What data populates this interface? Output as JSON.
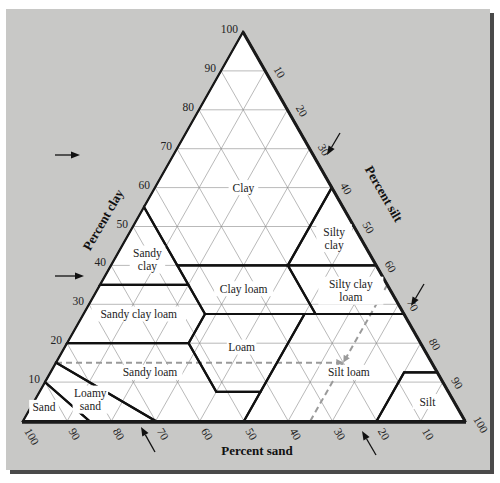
{
  "triangle": {
    "apex_clay": [
      243,
      32
    ],
    "corner_sand": [
      23,
      421
    ],
    "corner_silt": [
      465,
      421
    ]
  },
  "colors": {
    "panel": "#c8c8c6",
    "panel_shadow": "#4a4a4a",
    "triangle_fill": "#ffffff",
    "boundary": "#111111",
    "grid": "#8a8a8a",
    "dashed_guide": "#9a9a9a"
  },
  "axes": {
    "clay": {
      "title": "Percent clay",
      "ticks": [
        "10",
        "20",
        "30",
        "40",
        "50",
        "60",
        "70",
        "80",
        "90",
        "100"
      ]
    },
    "silt": {
      "title": "Percent silt",
      "ticks": [
        "10",
        "20",
        "30",
        "40",
        "50",
        "60",
        "70",
        "80",
        "90",
        "100"
      ]
    },
    "sand": {
      "title": "Percent sand",
      "ticks": [
        "100",
        "90",
        "80",
        "70",
        "60",
        "50",
        "40",
        "30",
        "20",
        "10"
      ]
    }
  },
  "regions": [
    {
      "name": "Clay",
      "label": [
        "Clay"
      ],
      "label_at": [
        60,
        20
      ],
      "points": [
        [
          40,
          45
        ],
        [
          55,
          45
        ],
        [
          100,
          0
        ],
        [
          60,
          0
        ],
        [
          40,
          20
        ]
      ]
    },
    {
      "name": "Sandy clay",
      "label": [
        "Sandy",
        "clay"
      ],
      "label_at": [
        41.5,
        51
      ],
      "points": [
        [
          35,
          65
        ],
        [
          55,
          45
        ],
        [
          35,
          45
        ]
      ]
    },
    {
      "name": "Silty clay",
      "label": [
        "Silty",
        "clay"
      ],
      "label_at": [
        47,
        6
      ],
      "points": [
        [
          40,
          20
        ],
        [
          60,
          0
        ],
        [
          40,
          0
        ]
      ]
    },
    {
      "name": "Sandy clay loam",
      "label": [
        "Sandy clay loam"
      ],
      "label_at": [
        27.5,
        60
      ],
      "points": [
        [
          20,
          80
        ],
        [
          35,
          65
        ],
        [
          35,
          45
        ],
        [
          27.5,
          45
        ],
        [
          20,
          52.5
        ]
      ]
    },
    {
      "name": "Clay loam",
      "label": [
        "Clay loam"
      ],
      "label_at": [
        34,
        33
      ],
      "points": [
        [
          27.5,
          45
        ],
        [
          40,
          45
        ],
        [
          40,
          20
        ],
        [
          27.5,
          20
        ]
      ]
    },
    {
      "name": "Silty clay loam",
      "label": [
        "Silty clay",
        "loam"
      ],
      "label_at": [
        33.5,
        9
      ],
      "points": [
        [
          27.5,
          20
        ],
        [
          40,
          20
        ],
        [
          40,
          0
        ],
        [
          27.5,
          0
        ]
      ]
    },
    {
      "name": "Loam",
      "label": [
        "Loam"
      ],
      "label_at": [
        19,
        41
      ],
      "points": [
        [
          7.5,
          52.5
        ],
        [
          20,
          52.5
        ],
        [
          27.5,
          45
        ],
        [
          27.5,
          22.5
        ],
        [
          7.5,
          42.5
        ]
      ]
    },
    {
      "name": "Sandy loam",
      "label": [
        "Sandy loam"
      ],
      "label_at": [
        12.5,
        65
      ],
      "points": [
        [
          0,
          70
        ],
        [
          15,
          85
        ],
        [
          20,
          80
        ],
        [
          20,
          52.5
        ],
        [
          7.5,
          52.5
        ],
        [
          7.5,
          42.5
        ],
        [
          0,
          50
        ]
      ]
    },
    {
      "name": "Silt loam",
      "label": [
        "Silt loam"
      ],
      "label_at": [
        12.5,
        20
      ],
      "points": [
        [
          0,
          50
        ],
        [
          7.5,
          42.5
        ],
        [
          27.5,
          22.5
        ],
        [
          27.5,
          0
        ],
        [
          12.5,
          0
        ],
        [
          12.5,
          7.5
        ],
        [
          0,
          20
        ]
      ]
    },
    {
      "name": "Silt",
      "label": [
        "Silt"
      ],
      "label_at": [
        5,
        6
      ],
      "points": [
        [
          0,
          20
        ],
        [
          12.5,
          7.5
        ],
        [
          12.5,
          0
        ],
        [
          0,
          0
        ]
      ]
    },
    {
      "name": "Loamy sand",
      "label": [
        "Loamy",
        "sand"
      ],
      "label_at": [
        5.5,
        82
      ],
      "points": [
        [
          0,
          85
        ],
        [
          10,
          90
        ],
        [
          15,
          85
        ],
        [
          0,
          70
        ]
      ]
    },
    {
      "name": "Sand",
      "label": [
        "Sand"
      ],
      "label_at": [
        3.5,
        93.5
      ],
      "points": [
        [
          0,
          100
        ],
        [
          10,
          90
        ],
        [
          0,
          85
        ]
      ]
    }
  ],
  "guides": {
    "example_point": {
      "clay": 15,
      "sand": 20,
      "silt": 65
    },
    "dashed_lines": [
      {
        "from": [
          15,
          85
        ],
        "to": [
          15,
          20
        ]
      },
      {
        "from": [
          0,
          35
        ],
        "to": [
          15,
          20
        ]
      },
      {
        "from": [
          35,
          0
        ],
        "to": [
          15,
          20
        ]
      }
    ]
  },
  "arrows": [
    {
      "name": "clay-axis-arrow-upper",
      "from": [
        55,
        155
      ],
      "to": [
        80,
        155
      ]
    },
    {
      "name": "clay-axis-arrow-lower",
      "from": [
        55,
        276
      ],
      "to": [
        84,
        276
      ]
    },
    {
      "name": "silt-axis-arrow-upper",
      "from": [
        340,
        133
      ],
      "to": [
        327,
        155
      ]
    },
    {
      "name": "silt-axis-arrow-lower",
      "from": [
        424,
        284
      ],
      "to": [
        411,
        306
      ]
    },
    {
      "name": "sand-axis-arrow-left",
      "from": [
        155,
        452
      ],
      "to": [
        141,
        427
      ]
    },
    {
      "name": "sand-axis-arrow-right",
      "from": [
        376,
        455
      ],
      "to": [
        362,
        431
      ]
    }
  ]
}
